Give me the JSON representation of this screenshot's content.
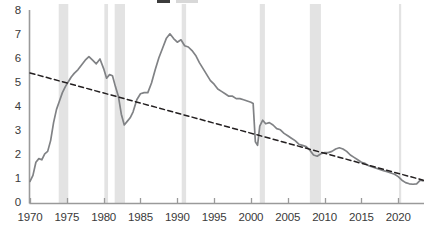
{
  "chart_data": {
    "type": "line",
    "title": "",
    "xlabel": "",
    "ylabel": "",
    "xlim": [
      1970,
      2023.5
    ],
    "ylim": [
      0,
      8
    ],
    "grid": false,
    "legend_position": "top",
    "y_ticks": [
      "8",
      "7",
      "6",
      "5",
      "4",
      "3",
      "2",
      "1",
      "0"
    ],
    "y_tick_values": [
      8,
      7,
      6,
      5,
      4,
      3,
      2,
      1,
      0
    ],
    "x_ticks": [
      "1970",
      "1975",
      "1980",
      "1985",
      "1990",
      "1995",
      "2000",
      "2005",
      "2010",
      "2015",
      "2020"
    ],
    "x_tick_values": [
      1970,
      1975,
      1980,
      1985,
      1990,
      1995,
      2000,
      2005,
      2010,
      2015,
      2020
    ],
    "series": [
      {
        "name": "series-solid",
        "style": "solid",
        "color": "#808285",
        "x": [
          1970.0,
          1970.4,
          1970.8,
          1971.2,
          1971.6,
          1972.0,
          1972.4,
          1972.8,
          1973.2,
          1973.6,
          1974.0,
          1974.4,
          1974.8,
          1975.2,
          1975.6,
          1976.0,
          1976.5,
          1977.0,
          1977.5,
          1978.0,
          1978.5,
          1979.0,
          1979.5,
          1980.0,
          1980.4,
          1980.8,
          1981.2,
          1981.6,
          1982.0,
          1982.4,
          1982.8,
          1983.2,
          1983.6,
          1984.0,
          1984.5,
          1985.0,
          1985.5,
          1986.0,
          1986.5,
          1987.0,
          1987.5,
          1988.0,
          1988.5,
          1989.0,
          1989.5,
          1990.0,
          1990.5,
          1991.0,
          1991.5,
          1992.0,
          1992.5,
          1993.0,
          1993.5,
          1994.0,
          1994.5,
          1995.0,
          1995.5,
          1996.0,
          1996.5,
          1997.0,
          1997.5,
          1998.0,
          1998.5,
          1999.0,
          1999.5,
          2000.0,
          2000.3,
          2000.6,
          2000.9,
          2001.2,
          2001.6,
          2002.0,
          2002.5,
          2003.0,
          2003.5,
          2004.0,
          2004.5,
          2005.0,
          2005.5,
          2006.0,
          2006.5,
          2007.0,
          2007.5,
          2008.0,
          2008.5,
          2009.0,
          2009.5,
          2010.0,
          2010.5,
          2011.0,
          2011.5,
          2012.0,
          2012.5,
          2013.0,
          2013.5,
          2014.0,
          2014.5,
          2015.0,
          2015.5,
          2016.0,
          2016.5,
          2017.0,
          2017.5,
          2018.0,
          2018.5,
          2019.0,
          2019.5,
          2020.0,
          2020.5,
          2021.0,
          2021.5,
          2022.0,
          2022.5,
          2023.0,
          2023.4
        ],
        "y": [
          0.9,
          1.15,
          1.7,
          1.85,
          1.8,
          2.05,
          2.15,
          2.6,
          3.35,
          3.9,
          4.25,
          4.6,
          4.85,
          5.05,
          5.25,
          5.4,
          5.55,
          5.75,
          5.95,
          6.1,
          5.95,
          5.8,
          6.0,
          5.6,
          5.2,
          5.35,
          5.3,
          4.85,
          4.45,
          3.7,
          3.25,
          3.4,
          3.55,
          3.8,
          4.3,
          4.55,
          4.6,
          4.6,
          5.0,
          5.55,
          6.05,
          6.45,
          6.85,
          7.05,
          6.85,
          6.7,
          6.8,
          6.55,
          6.5,
          6.35,
          6.15,
          5.85,
          5.6,
          5.35,
          5.1,
          4.95,
          4.75,
          4.65,
          4.55,
          4.45,
          4.45,
          4.35,
          4.35,
          4.3,
          4.25,
          4.2,
          4.15,
          2.55,
          2.4,
          3.2,
          3.45,
          3.3,
          3.35,
          3.25,
          3.1,
          3.05,
          2.9,
          2.8,
          2.7,
          2.6,
          2.45,
          2.4,
          2.35,
          2.2,
          2.0,
          1.95,
          2.05,
          2.1,
          2.1,
          2.15,
          2.25,
          2.3,
          2.25,
          2.15,
          2.0,
          1.9,
          1.8,
          1.7,
          1.65,
          1.55,
          1.5,
          1.45,
          1.4,
          1.35,
          1.3,
          1.25,
          1.2,
          1.1,
          0.95,
          0.85,
          0.8,
          0.78,
          0.8,
          0.95,
          0.92
        ]
      },
      {
        "name": "series-dashed-trend",
        "style": "dashed",
        "color": "#231f20",
        "x": [
          1970.0,
          2023.4
        ],
        "y": [
          5.42,
          0.95
        ]
      }
    ],
    "shaded_bands": [
      {
        "name": "recession-1973-1975",
        "start": 1973.9,
        "end": 1975.2
      },
      {
        "name": "recession-1980",
        "start": 1980.1,
        "end": 1980.6
      },
      {
        "name": "recession-1981-1982",
        "start": 1981.5,
        "end": 1982.9
      },
      {
        "name": "recession-1990-1991",
        "start": 1990.6,
        "end": 1991.2
      },
      {
        "name": "recession-2001",
        "start": 2001.2,
        "end": 2001.9
      },
      {
        "name": "recession-2008-2009",
        "start": 2008.0,
        "end": 2009.5
      },
      {
        "name": "recession-2020",
        "start": 2020.1,
        "end": 2020.4
      }
    ],
    "band_color": "#e3e3e3",
    "axis_color": "#9a9a9a",
    "tick_text_color": "#3a3a3a"
  },
  "legend_strip": {
    "note": "cropped legend row at top edge",
    "items": [
      {
        "name": "legend-swatch-dark",
        "color": "#3c3c3c"
      },
      {
        "name": "legend-swatch-light",
        "color": "#d8d8d8"
      }
    ]
  }
}
